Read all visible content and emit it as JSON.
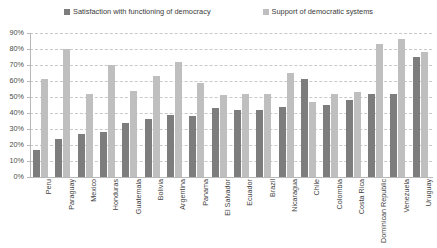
{
  "legend": {
    "position": "top-center",
    "entries": [
      {
        "label": "Satisfaction with functioning of democracy",
        "swatch_name": "legend-swatch-dark",
        "color": "#7d7d7d"
      },
      {
        "label": "Support of democratic systems",
        "swatch_name": "legend-swatch-light",
        "color": "#bfbfbf"
      }
    ]
  },
  "axis": {
    "y_ticks": [
      "0%",
      "10%",
      "20%",
      "30%",
      "40%",
      "50%",
      "60%",
      "70%",
      "80%",
      "90%"
    ]
  },
  "chart_data": {
    "type": "bar",
    "title": "",
    "xlabel": "",
    "ylabel": "",
    "ylim": [
      0,
      90
    ],
    "ytick_step": 10,
    "grid": true,
    "legend_position": "top-center",
    "categories": [
      "Peru",
      "Paraguay",
      "Mexico",
      "Honduras",
      "Guatemala",
      "Bolivia",
      "Argentina",
      "Panama",
      "El Salvador",
      "Ecuador",
      "Brazil",
      "Nicaragua",
      "Chile",
      "Colombia",
      "Costa Rica",
      "Dominican Republic",
      "Venezuela",
      "Uruguay"
    ],
    "series": [
      {
        "name": "Satisfaction with functioning of democracy",
        "color": "#7d7d7d",
        "values": [
          17,
          24,
          27,
          28,
          34,
          36,
          39,
          38,
          43,
          42,
          42,
          44,
          61,
          45,
          48,
          52,
          52,
          75
        ]
      },
      {
        "name": "Support of democratic systems",
        "color": "#bfbfbf",
        "values": [
          61,
          80,
          52,
          70,
          54,
          63,
          72,
          59,
          51,
          52,
          52,
          65,
          47,
          52,
          53,
          83,
          86,
          78
        ]
      }
    ]
  }
}
